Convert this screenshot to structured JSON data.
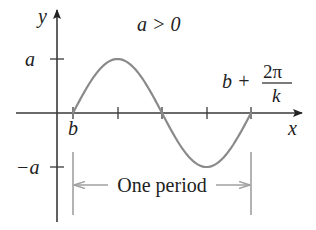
{
  "diagram": {
    "condition_label": "a > 0",
    "axes": {
      "x_label": "x",
      "y_label": "y"
    },
    "y_ticks": [
      {
        "label": "a",
        "value": "a"
      },
      {
        "label": "−a",
        "value": "-a"
      }
    ],
    "x_markers": {
      "start_label": "b",
      "end_label_prefix": "b +",
      "end_label_numerator": "2π",
      "end_label_denominator": "k"
    },
    "period_label": "One period",
    "colors": {
      "axis": "#3a3a3a",
      "curve": "#8a8a8a",
      "bracket": "#a0a0a0",
      "text": "#222222"
    }
  },
  "chart_data": {
    "type": "line",
    "title": "a > 0",
    "xlabel": "x",
    "ylabel": "y",
    "x": [
      "b",
      "b + π/(2k)",
      "b + π/k",
      "b + 3π/(2k)",
      "b + 2π/k"
    ],
    "values": [
      "0",
      "a",
      "0",
      "-a",
      "0"
    ],
    "y_ticks": [
      "a",
      "-a"
    ],
    "annotations": [
      "One period (from b to b + 2π/k)"
    ],
    "grid": false
  }
}
